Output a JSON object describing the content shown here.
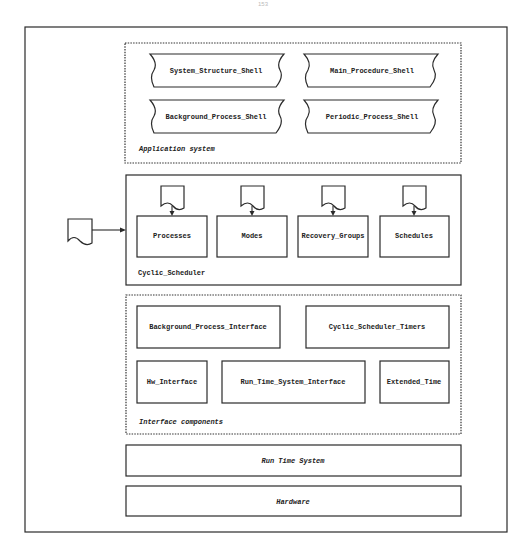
{
  "page_number": "153",
  "application_system": {
    "label": "Application system",
    "shells": [
      "System_Structure_Shell",
      "Main_Procedure_Shell",
      "Background_Process_Shell",
      "Periodic_Process_Shell"
    ]
  },
  "cyclic_scheduler": {
    "label": "Cyclic_Scheduler",
    "components": [
      "Processes",
      "Modes",
      "Recovery_Groups",
      "Schedules"
    ]
  },
  "interface_components": {
    "label": "Interface components",
    "components": [
      "Background_Process_Interface",
      "Cyclic_Scheduler_Timers",
      "Hw_Interface",
      "Run_Time_System_Interface",
      "Extended_Time"
    ]
  },
  "run_time_system": {
    "label": "Run Time System"
  },
  "hardware": {
    "label": "Hardware"
  }
}
